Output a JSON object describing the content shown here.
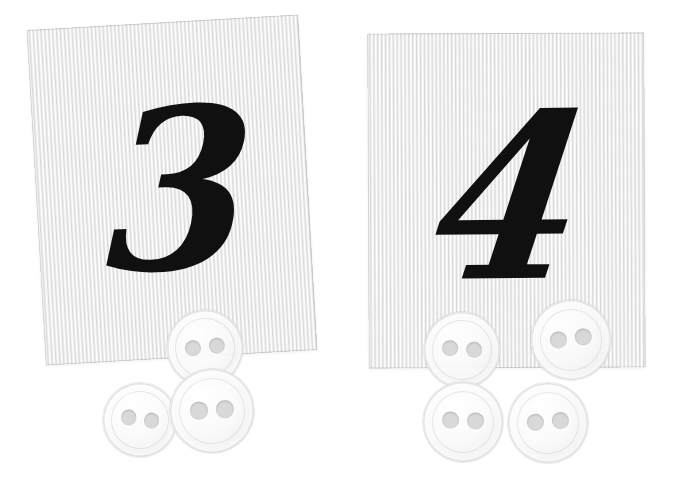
{
  "scene": {
    "title": "Number cards with counting buttons",
    "background_color": "#ffffff",
    "width": 680,
    "height": 496
  },
  "cards": [
    {
      "id": "card-left",
      "numeral": "3",
      "numeral_label": "three",
      "button_count": 3,
      "card_color": "#eeeeee",
      "numeral_color": "#101010",
      "texture": "vertical-corrugated-stripes"
    },
    {
      "id": "card-right",
      "numeral": "4",
      "numeral_label": "four",
      "button_count": 4,
      "card_color": "#eeeeee",
      "numeral_color": "#101010",
      "texture": "vertical-corrugated-stripes"
    }
  ],
  "buttons": {
    "left_group": [
      {
        "name": "button-left-top",
        "x": 205,
        "y": 348,
        "r": 38,
        "rotation": -6
      },
      {
        "name": "button-left-lower",
        "x": 140,
        "y": 420,
        "r": 37,
        "rotation": 8
      },
      {
        "name": "button-left-right",
        "x": 212,
        "y": 411,
        "r": 42,
        "rotation": -3
      }
    ],
    "right_group": [
      {
        "name": "button-right-upper-left",
        "x": 462,
        "y": 350,
        "r": 38,
        "rotation": 4
      },
      {
        "name": "button-right-upper-right",
        "x": 571,
        "y": 340,
        "r": 40,
        "rotation": -7
      },
      {
        "name": "button-right-lower-left",
        "x": 463,
        "y": 422,
        "r": 40,
        "rotation": 2
      },
      {
        "name": "button-right-lower-right",
        "x": 548,
        "y": 423,
        "r": 40,
        "rotation": -4
      }
    ],
    "holes_per_button": 2,
    "button_color": "#fafafa",
    "hole_color": "#cecece"
  }
}
